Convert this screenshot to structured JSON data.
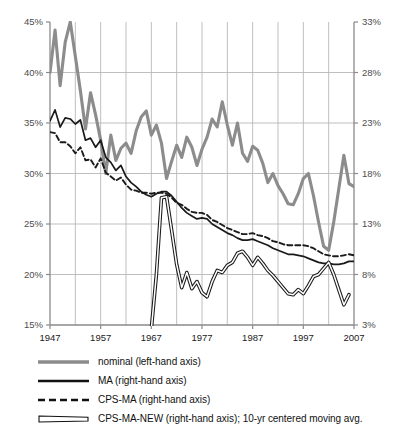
{
  "chart_data": {
    "type": "line",
    "title": "",
    "xlabel": "",
    "ylabel": "",
    "x_range": [
      1947,
      2007
    ],
    "x_ticks": [
      "1947",
      "1957",
      "1967",
      "1977",
      "1987",
      "1997",
      "2007"
    ],
    "x_tick_values": [
      1947,
      1957,
      1967,
      1977,
      1987,
      1997,
      2007
    ],
    "x_minor_tick_values": [
      1952,
      1962,
      1972,
      1982,
      1992,
      2002
    ],
    "grid": true,
    "legend_position": "below",
    "left_axis": {
      "name": "left-hand axis",
      "ylim": [
        15,
        45
      ],
      "ticks": [
        "15%",
        "20%",
        "25%",
        "30%",
        "35%",
        "40%",
        "45%"
      ],
      "tick_values": [
        15,
        20,
        25,
        30,
        35,
        40,
        45
      ]
    },
    "right_axis": {
      "name": "right-hand axis",
      "ylim": [
        3,
        33
      ],
      "ticks": [
        "3%",
        "8%",
        "13%",
        "18%",
        "23%",
        "28%",
        "33%"
      ],
      "tick_values": [
        3,
        8,
        13,
        18,
        23,
        28,
        33
      ]
    },
    "series": [
      {
        "name": "nominal (left-hand axis)",
        "axis": "left",
        "style": "solid-thick-gray",
        "color": "#8c8c8c",
        "x": [
          1947,
          1948,
          1949,
          1950,
          1951,
          1952,
          1953,
          1954,
          1955,
          1956,
          1957,
          1958,
          1959,
          1960,
          1961,
          1962,
          1963,
          1964,
          1965,
          1966,
          1967,
          1968,
          1969,
          1970,
          1971,
          1972,
          1973,
          1974,
          1975,
          1976,
          1977,
          1978,
          1979,
          1980,
          1981,
          1982,
          1983,
          1984,
          1985,
          1986,
          1987,
          1988,
          1989,
          1990,
          1991,
          1992,
          1993,
          1994,
          1995,
          1996,
          1997,
          1998,
          1999,
          2000,
          2001,
          2002,
          2003,
          2004,
          2005,
          2006,
          2007
        ],
        "values": [
          40.0,
          44.2,
          38.7,
          43.0,
          45.0,
          41.6,
          38.2,
          34.4,
          38.0,
          35.8,
          33.3,
          30.0,
          33.8,
          31.3,
          32.5,
          33.0,
          32.0,
          34.2,
          35.6,
          36.2,
          33.8,
          34.8,
          33.0,
          29.5,
          31.2,
          32.8,
          31.6,
          33.6,
          32.6,
          30.8,
          32.4,
          33.6,
          35.4,
          34.6,
          37.1,
          34.8,
          32.8,
          35.0,
          32.0,
          31.2,
          32.7,
          32.3,
          31.0,
          29.1,
          30.0,
          28.8,
          28.0,
          27.0,
          26.9,
          28.0,
          29.5,
          30.0,
          27.8,
          25.2,
          22.8,
          22.4,
          25.2,
          28.5,
          31.8,
          29.0,
          28.7
        ]
      },
      {
        "name": "MA (right-hand axis)",
        "axis": "right",
        "style": "solid-thin-black",
        "color": "#1a1a1a",
        "x": [
          1947,
          1948,
          1949,
          1950,
          1951,
          1952,
          1953,
          1954,
          1955,
          1956,
          1957,
          1958,
          1959,
          1960,
          1961,
          1962,
          1963,
          1964,
          1965,
          1966,
          1967,
          1968,
          1969,
          1970,
          1971,
          1972,
          1973,
          1974,
          1975,
          1976,
          1977,
          1978,
          1979,
          1980,
          1981,
          1982,
          1983,
          1984,
          1985,
          1986,
          1987,
          1988,
          1989,
          1990,
          1991,
          1992,
          1993,
          1994,
          1995,
          1996,
          1997,
          1998,
          1999,
          2000,
          2001,
          2002,
          2003,
          2004,
          2005,
          2006,
          2007
        ],
        "values": [
          23.2,
          24.3,
          22.6,
          23.5,
          23.4,
          22.9,
          23.3,
          21.3,
          21.5,
          20.6,
          21.3,
          19.6,
          19.1,
          18.3,
          18.8,
          17.7,
          17.1,
          16.7,
          16.2,
          15.9,
          15.7,
          16.0,
          16.2,
          16.2,
          15.8,
          15.2,
          14.6,
          14.1,
          13.8,
          13.5,
          13.6,
          13.5,
          13.0,
          12.7,
          12.4,
          12.1,
          11.9,
          11.6,
          11.4,
          11.4,
          11.5,
          11.3,
          11.1,
          10.9,
          10.6,
          10.4,
          10.2,
          10.0,
          10.0,
          9.9,
          9.8,
          9.6,
          9.4,
          9.2,
          9.1,
          9.1,
          9.0,
          9.0,
          9.1,
          9.3,
          9.3
        ]
      },
      {
        "name": "CPS-MA (right-hand axis)",
        "axis": "right",
        "style": "dashed-black",
        "color": "#1a1a1a",
        "x": [
          1947,
          1948,
          1949,
          1950,
          1951,
          1952,
          1953,
          1954,
          1955,
          1956,
          1957,
          1958,
          1959,
          1960,
          1961,
          1962,
          1963,
          1964,
          1965,
          1966,
          1967,
          1968,
          1969,
          1970,
          1971,
          1972,
          1973,
          1974,
          1975,
          1976,
          1977,
          1978,
          1979,
          1980,
          1981,
          1982,
          1983,
          1984,
          1985,
          1986,
          1987,
          1988,
          1989,
          1990,
          1991,
          1992,
          1993,
          1994,
          1995,
          1996,
          1997,
          1998,
          1999,
          2000,
          2001,
          2002,
          2003,
          2004,
          2005,
          2006,
          2007
        ],
        "values": [
          22.1,
          22.0,
          21.1,
          21.1,
          20.7,
          20.0,
          20.6,
          19.3,
          19.4,
          18.6,
          19.5,
          18.1,
          17.7,
          17.3,
          17.6,
          16.9,
          16.4,
          16.3,
          16.1,
          16.1,
          16.0,
          16.1,
          16.1,
          16.0,
          15.6,
          15.1,
          14.9,
          14.5,
          14.2,
          14.1,
          14.1,
          13.9,
          13.4,
          13.2,
          12.9,
          12.6,
          12.4,
          12.2,
          12.0,
          12.0,
          12.1,
          11.9,
          11.8,
          11.6,
          11.3,
          11.2,
          11.0,
          10.9,
          10.9,
          10.9,
          10.9,
          10.8,
          10.6,
          10.3,
          10.0,
          9.9,
          9.8,
          9.8,
          9.9,
          10.0,
          9.9
        ]
      },
      {
        "name": "CPS-MA-NEW (right-hand axis); 10-yr centered moving avg.",
        "axis": "right",
        "style": "double-line-black",
        "color": "#1a1a1a",
        "x": [
          1967,
          1968,
          1969,
          1970,
          1971,
          1972,
          1973,
          1974,
          1975,
          1976,
          1977,
          1978,
          1979,
          1980,
          1981,
          1982,
          1983,
          1984,
          1985,
          1986,
          1987,
          1988,
          1989,
          1990,
          1991,
          1992,
          1993,
          1994,
          1995,
          1996,
          1997,
          1998,
          1999,
          2000,
          2001,
          2002,
          2003,
          2004,
          2005,
          2006
        ],
        "values": [
          2.6,
          8.0,
          15.6,
          15.7,
          12.4,
          9.0,
          6.7,
          8.2,
          6.6,
          7.3,
          6.2,
          5.8,
          7.3,
          8.4,
          8.2,
          8.9,
          9.2,
          10.1,
          10.3,
          9.7,
          8.9,
          9.7,
          9.1,
          8.4,
          7.9,
          7.3,
          6.7,
          6.1,
          6.0,
          6.5,
          6.1,
          6.9,
          7.8,
          8.0,
          8.6,
          9.2,
          8.0,
          6.5,
          5.0,
          6.0
        ]
      }
    ]
  },
  "legend": {
    "items": [
      {
        "label": "nominal (left-hand axis)",
        "swatch": "solid-thick-gray-swatch"
      },
      {
        "label": "MA (right-hand axis)",
        "swatch": "solid-thick-black-swatch"
      },
      {
        "label": "CPS-MA (right-hand axis)",
        "swatch": "dashed-black-swatch"
      },
      {
        "label": "CPS-MA-NEW (right-hand axis); 10-yr centered moving avg.",
        "swatch": "double-line-black-swatch"
      }
    ]
  },
  "colors": {
    "nominal": "#8c8c8c",
    "series_black": "#1a1a1a",
    "grid": "#b8b8b8",
    "axis": "#8a8a8a",
    "tick_text": "#4d4d4d",
    "background": "#ffffff"
  }
}
